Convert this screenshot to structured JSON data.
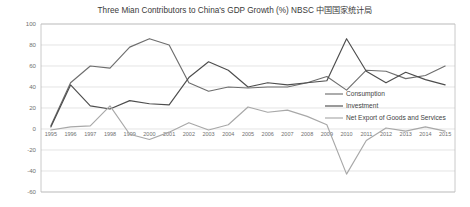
{
  "chart_data": {
    "type": "line",
    "title": "Three Mian Contributors to China's GDP Growth (%) NBSC 中国国家统计局",
    "xlabel": "",
    "ylabel": "",
    "grid": true,
    "legend_position": "inside-right",
    "ylim": [
      -60,
      100
    ],
    "yticks": [
      100,
      80,
      60,
      40,
      20,
      0,
      -20,
      -40,
      -60
    ],
    "categories": [
      "1995",
      "1996",
      "1997",
      "1998",
      "1999",
      "2000",
      "2001",
      "2002",
      "2003",
      "2004",
      "2005",
      "2006",
      "2007",
      "2008",
      "2009",
      "2010",
      "2011",
      "2012",
      "2013",
      "2014",
      "2015"
    ],
    "series": [
      {
        "name": "Consumption",
        "color": "#6e6e6e",
        "values": [
          3,
          44,
          60,
          58,
          78,
          86,
          80,
          44,
          36,
          40,
          39,
          40,
          40,
          44,
          50,
          37,
          56,
          55,
          48,
          51,
          60
        ]
      },
      {
        "name": "Investment",
        "color": "#4d4d4d",
        "values": [
          2,
          42,
          22,
          19,
          27,
          24,
          23,
          49,
          64,
          56,
          40,
          44,
          42,
          44,
          46,
          86,
          55,
          44,
          54,
          47,
          42
        ]
      },
      {
        "name": "Net Export of Goods and Services",
        "color": "#a8a8a8",
        "values": [
          -1,
          2,
          3,
          22,
          -5,
          -10,
          -3,
          6,
          -1,
          4,
          21,
          16,
          18,
          12,
          4,
          -43,
          -11,
          1,
          -2,
          2,
          -2
        ]
      }
    ]
  },
  "legend": {
    "items": [
      {
        "label": "Consumption"
      },
      {
        "label": "Investment"
      },
      {
        "label": "Net Export of Goods and Services"
      }
    ]
  }
}
